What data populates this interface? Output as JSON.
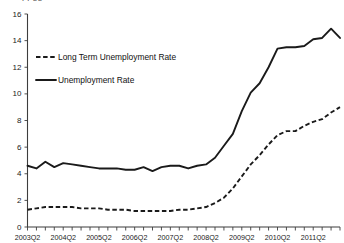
{
  "title_clipped": "ppgg",
  "chart_data": {
    "type": "line",
    "title": "",
    "xlabel": "",
    "ylabel": "",
    "ylim": [
      0,
      16
    ],
    "yticks": [
      0,
      2,
      4,
      6,
      8,
      10,
      12,
      14,
      16
    ],
    "xtick_labels": [
      "2003Q2",
      "2004Q2",
      "2005Q2",
      "2006Q2",
      "2007Q2",
      "2008Q2",
      "2009Q2",
      "2010Q2",
      "2011Q2"
    ],
    "grid": false,
    "legend_position": "upper-left",
    "x_start": "2003Q2",
    "x_end": "2012Q1",
    "x_points": [
      "2003Q2",
      "2003Q3",
      "2003Q4",
      "2004Q1",
      "2004Q2",
      "2004Q3",
      "2004Q4",
      "2005Q1",
      "2005Q2",
      "2005Q3",
      "2005Q4",
      "2006Q1",
      "2006Q2",
      "2006Q3",
      "2006Q4",
      "2007Q1",
      "2007Q2",
      "2007Q3",
      "2007Q4",
      "2008Q1",
      "2008Q2",
      "2008Q3",
      "2008Q4",
      "2009Q1",
      "2009Q2",
      "2009Q3",
      "2009Q4",
      "2010Q1",
      "2010Q2",
      "2010Q3",
      "2010Q4",
      "2011Q1",
      "2011Q2",
      "2011Q3",
      "2011Q4",
      "2012Q1"
    ],
    "series": [
      {
        "name": "Long Term Unemployment Rate",
        "style": "dashed",
        "color": "#1a1a1a",
        "values": [
          1.3,
          1.4,
          1.5,
          1.5,
          1.5,
          1.5,
          1.4,
          1.4,
          1.4,
          1.3,
          1.3,
          1.3,
          1.2,
          1.2,
          1.2,
          1.2,
          1.2,
          1.3,
          1.3,
          1.4,
          1.5,
          1.8,
          2.2,
          2.9,
          3.8,
          4.7,
          5.4,
          6.2,
          6.9,
          7.2,
          7.2,
          7.6,
          7.9,
          8.1,
          8.6,
          9.0
        ]
      },
      {
        "name": "Unemployment Rate",
        "style": "solid",
        "color": "#1a1a1a",
        "values": [
          4.6,
          4.4,
          4.9,
          4.5,
          4.8,
          4.7,
          4.6,
          4.5,
          4.4,
          4.4,
          4.4,
          4.3,
          4.3,
          4.5,
          4.2,
          4.5,
          4.6,
          4.6,
          4.4,
          4.6,
          4.7,
          5.2,
          6.1,
          7.0,
          8.7,
          10.1,
          10.8,
          12.0,
          13.4,
          13.5,
          13.5,
          13.6,
          14.1,
          14.2,
          14.9,
          14.2
        ]
      }
    ]
  },
  "legend": {
    "items": [
      {
        "label": "Long Term Unemployment Rate",
        "style": "dashed"
      },
      {
        "label": "Unemployment Rate",
        "style": "solid"
      }
    ]
  }
}
